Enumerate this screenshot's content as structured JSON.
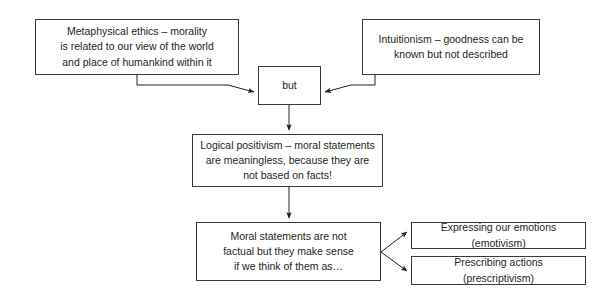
{
  "diagram": {
    "type": "flowchart",
    "colors": {
      "background": "#ffffff",
      "box_border": "#3a3a3a",
      "connector": "#231f20",
      "text": "#231f20"
    },
    "nodes": [
      {
        "id": "metaphysical",
        "text": "Metaphysical ethics – morality\nis related to our view of the world\nand place of humankind within it"
      },
      {
        "id": "intuitionism",
        "text": "Intuitionism – goodness can be\nknown but not described"
      },
      {
        "id": "but",
        "text": "but"
      },
      {
        "id": "positivism",
        "text": "Logical positivism – moral statements\nare meaningless, because they are\nnot based on facts!"
      },
      {
        "id": "moral",
        "text": "Moral statements are not\nfactual but they make sense\nif we think of them as…"
      },
      {
        "id": "emotivism",
        "text": "Expressing our emotions (emotivism)"
      },
      {
        "id": "prescriptivism",
        "text": "Prescribing actions (prescriptivism)"
      }
    ],
    "connectors": [
      {
        "id": "metaphysical-to-but",
        "from": "metaphysical",
        "to": "but",
        "arrow": true
      },
      {
        "id": "intuitionism-to-but",
        "from": "intuitionism",
        "to": "but",
        "arrow": true
      },
      {
        "id": "but-to-positivism",
        "from": "but",
        "to": "positivism",
        "arrow": true
      },
      {
        "id": "positivism-to-moral",
        "from": "positivism",
        "to": "moral",
        "arrow": true
      },
      {
        "id": "moral-to-emotivism",
        "from": "moral",
        "to": "emotivism",
        "arrow": true
      },
      {
        "id": "moral-to-prescriptivism",
        "from": "moral",
        "to": "prescriptivism",
        "arrow": true
      }
    ]
  }
}
